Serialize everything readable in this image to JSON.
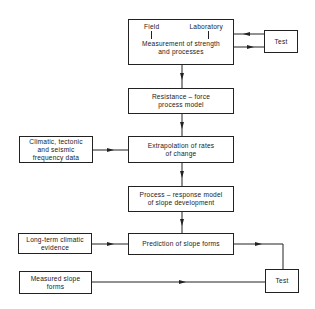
{
  "diagram": {
    "top_box": {
      "left_label": "Field",
      "right_label": "Laboratory",
      "line1": "Measurement of strength",
      "line2": "and processes"
    },
    "test_top": {
      "label": "Test"
    },
    "resistance_box": {
      "line1": "Resistance  –  force",
      "line2": "process  model"
    },
    "climatic_box": {
      "line1": "Climatic, tectonic",
      "line2": "and seismic",
      "line3": "frequency data"
    },
    "extrapolation_box": {
      "line1": "Extrapolation  of  rates",
      "line2": "of  change"
    },
    "process_box": {
      "line1": "Process – response model",
      "line2": "of  slope  development"
    },
    "longterm_box": {
      "line1": "Long-term  climatic",
      "line2": "evidence"
    },
    "prediction_box": {
      "line1": "Prediction of slope forms"
    },
    "measured_box": {
      "line1": "Measured slope",
      "line2": "forms"
    },
    "test_bottom": {
      "label": "Test"
    },
    "colors": {
      "line": "#222222",
      "background": "#ffffff"
    }
  }
}
